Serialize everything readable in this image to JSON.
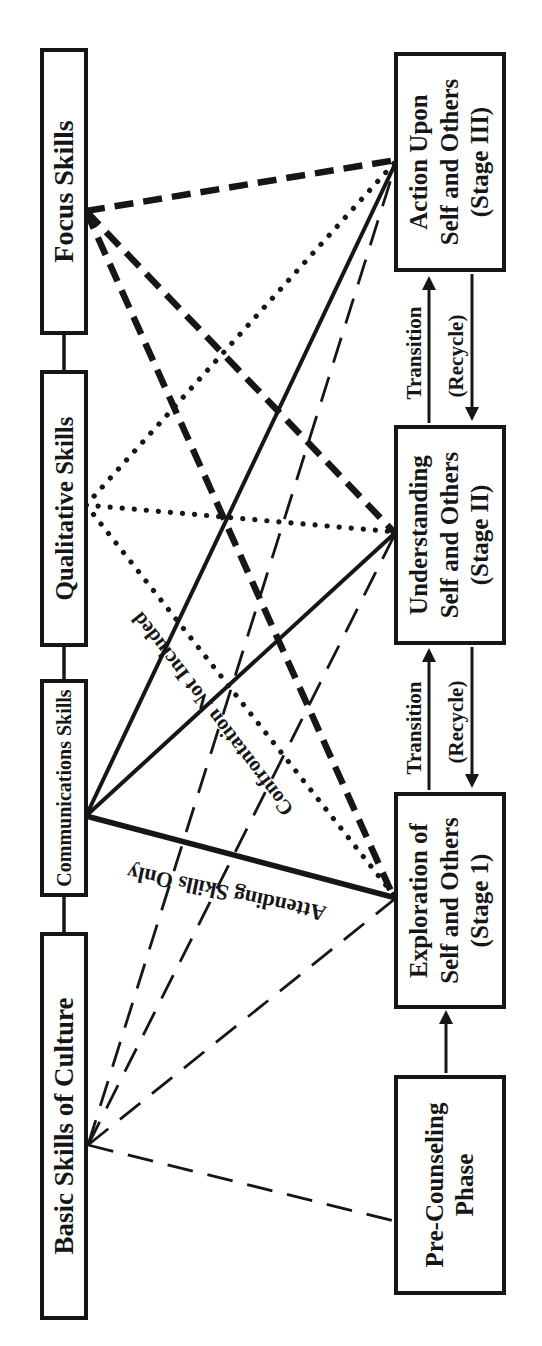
{
  "skills": [
    {
      "label": "Basic Skills of Culture"
    },
    {
      "label": "Communications Skills"
    },
    {
      "label": "Qualitative Skills"
    },
    {
      "label": "Focus Skills"
    }
  ],
  "stages": [
    {
      "lines": [
        "Pre-Counseling",
        "Phase",
        ""
      ]
    },
    {
      "lines": [
        "Exploration of",
        "Self and Others",
        "(Stage 1)"
      ]
    },
    {
      "lines": [
        "Understanding",
        "Self and Others",
        "(Stage II)"
      ]
    },
    {
      "lines": [
        "Action Upon",
        "Self and Others",
        "(Stage III)"
      ]
    }
  ],
  "flow": {
    "transition_label": "Transition",
    "recycle_label": "(Recycle)"
  },
  "line_labels": {
    "attending": "Attending Skills Only",
    "confrontation": "Confrontation Not Included"
  },
  "line_styles": {
    "basic_skills": "long-dash",
    "communications_skills": "solid",
    "qualitative_skills": "dotted",
    "focus_skills": "heavy-dash"
  },
  "colors": {
    "ink": "#161616",
    "paper": "#ffffff"
  }
}
